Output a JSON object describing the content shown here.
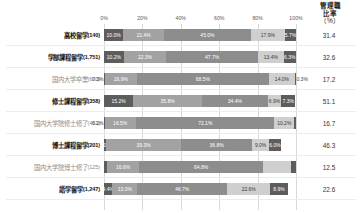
{
  "header": {
    "rate_col_title": "管理職\n比率",
    "rate_col_title_l1": "管理職",
    "rate_col_title_l2": "比率",
    "rate_col_unit": "（%）"
  },
  "chart_data": {
    "type": "bar",
    "orientation": "horizontal",
    "stacked": true,
    "normalized_percent": true,
    "title": "",
    "xlabel": "",
    "ylabel": "",
    "xlim": [
      0,
      100
    ],
    "xticks": [
      "0%",
      "20%",
      "40%",
      "60%",
      "80%",
      "100%"
    ],
    "xtick_values": [
      0,
      20,
      40,
      60,
      80,
      100
    ],
    "grid": true,
    "legend": "none",
    "categories": [
      "高校留学(140)",
      "学部課程留学(1,751)",
      "国内大学卒業(670)",
      "修士課程留学(358)",
      "国内大学院修士修了(461)",
      "博士課程留学(201)",
      "国内大学院博士修了(125)",
      "語学留学(1,247)"
    ],
    "series": [
      {
        "name": "segment-1",
        "values": [
          10.0,
          10.2,
          0.3,
          15.2,
          0.2,
          1.0,
          1.6,
          4.4
        ]
      },
      {
        "name": "segment-2",
        "values": [
          21.4,
          22.3,
          16.9,
          35.8,
          16.5,
          39.3,
          16.6,
          13.0
        ]
      },
      {
        "name": "segment-3",
        "values": [
          45.0,
          47.7,
          68.5,
          34.4,
          72.1,
          36.8,
          64.8,
          46.7
        ]
      },
      {
        "name": "segment-4",
        "values": [
          17.9,
          13.4,
          14.0,
          6.9,
          10.2,
          9.0,
          14.4,
          22.6
        ]
      },
      {
        "name": "segment-5",
        "values": [
          5.7,
          6.3,
          0.3,
          7.3,
          1.0,
          6.0,
          2.4,
          8.9
        ]
      }
    ],
    "rate_values": [
      31.4,
      32.6,
      17.2,
      51.1,
      16.7,
      46.3,
      12.5,
      22.6
    ]
  },
  "rows": [
    {
      "label": "高校留学",
      "count": "(140)",
      "emphasis": "strong",
      "rate": "31.4",
      "segments": [
        {
          "value": 10.0,
          "text": "10.0%",
          "placement": "inside"
        },
        {
          "value": 21.4,
          "text": "21.4%",
          "placement": "inside"
        },
        {
          "value": 45.0,
          "text": "45.0%",
          "placement": "inside"
        },
        {
          "value": 17.9,
          "text": "17.9%",
          "placement": "inside"
        },
        {
          "value": 5.7,
          "text": "5.7%",
          "placement": "inside"
        }
      ]
    },
    {
      "label": "学部課程留学",
      "count": "(1,751)",
      "emphasis": "strong",
      "rate": "32.6",
      "segments": [
        {
          "value": 10.2,
          "text": "10.2%",
          "placement": "inside"
        },
        {
          "value": 22.3,
          "text": "22.3%",
          "placement": "inside"
        },
        {
          "value": 47.7,
          "text": "47.7%",
          "placement": "inside"
        },
        {
          "value": 13.4,
          "text": "13.4%",
          "placement": "inside"
        },
        {
          "value": 6.3,
          "text": "6.3%",
          "placement": "inside"
        }
      ]
    },
    {
      "label": "国内大学卒業",
      "count": "(670)",
      "emphasis": "weak",
      "rate": "17.2",
      "segments": [
        {
          "value": 0.3,
          "text": "0.3%",
          "placement": "outside-left"
        },
        {
          "value": 16.9,
          "text": "16.9%",
          "placement": "inside"
        },
        {
          "value": 68.5,
          "text": "68.5%",
          "placement": "inside"
        },
        {
          "value": 14.0,
          "text": "14.0%",
          "placement": "inside"
        },
        {
          "value": 0.3,
          "text": "0.3%",
          "placement": "outside-right"
        }
      ]
    },
    {
      "label": "修士課程留学",
      "count": "(358)",
      "emphasis": "strong",
      "rate": "51.1",
      "segments": [
        {
          "value": 15.2,
          "text": "15.2%",
          "placement": "inside"
        },
        {
          "value": 35.8,
          "text": "35.8%",
          "placement": "inside"
        },
        {
          "value": 34.4,
          "text": "34.4%",
          "placement": "inside"
        },
        {
          "value": 6.9,
          "text": "6.9%",
          "placement": "inside"
        },
        {
          "value": 7.3,
          "text": "7.3%",
          "placement": "inside"
        }
      ]
    },
    {
      "label": "国内大学院修士修了",
      "count": "(461)",
      "emphasis": "weak",
      "rate": "16.7",
      "segments": [
        {
          "value": 0.2,
          "text": "0.2%",
          "placement": "outside-left"
        },
        {
          "value": 16.5,
          "text": "16.5%",
          "placement": "inside"
        },
        {
          "value": 72.1,
          "text": "72.1%",
          "placement": "inside"
        },
        {
          "value": 10.2,
          "text": "10.2%",
          "placement": "inside"
        },
        {
          "value": 1.0,
          "text": "1.0%",
          "placement": "hidden"
        }
      ]
    },
    {
      "label": "博士課程留学",
      "count": "(201)",
      "emphasis": "strong",
      "rate": "46.3",
      "segments": [
        {
          "value": 1.0,
          "text": "1.0%",
          "placement": "inside"
        },
        {
          "value": 39.3,
          "text": "39.3%",
          "placement": "inside"
        },
        {
          "value": 36.8,
          "text": "36.8%",
          "placement": "inside"
        },
        {
          "value": 9.0,
          "text": "9.0%",
          "placement": "inside"
        },
        {
          "value": 6.0,
          "text": "6.0%",
          "placement": "inside"
        }
      ]
    },
    {
      "label": "国内大学院博士修了",
      "count": "(125)",
      "emphasis": "weak",
      "rate": "12.5",
      "segments": [
        {
          "value": 1.6,
          "text": "1.6%",
          "placement": "hidden"
        },
        {
          "value": 16.6,
          "text": "16.6%",
          "placement": "inside"
        },
        {
          "value": 64.8,
          "text": "64.8%",
          "placement": "inside"
        },
        {
          "value": 14.4,
          "text": "14.4%",
          "placement": "hidden"
        },
        {
          "value": 2.4,
          "text": "2.4%",
          "placement": "hidden"
        }
      ]
    },
    {
      "label": "語学留学",
      "count": "(1,247)",
      "emphasis": "strong",
      "rate": "22.6",
      "segments": [
        {
          "value": 4.4,
          "text": "4.4%",
          "placement": "inside"
        },
        {
          "value": 13.0,
          "text": "13.0%",
          "placement": "inside"
        },
        {
          "value": 46.7,
          "text": "46.7%",
          "placement": "inside"
        },
        {
          "value": 22.6,
          "text": "22.6%",
          "placement": "inside"
        },
        {
          "value": 8.9,
          "text": "8.9%",
          "placement": "inside"
        }
      ]
    }
  ]
}
